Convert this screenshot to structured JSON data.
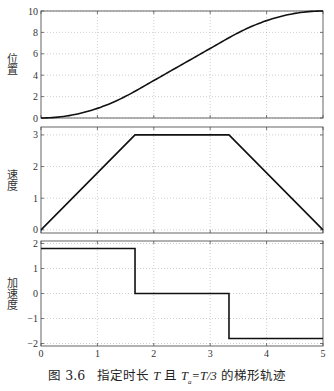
{
  "caption": {
    "figure_number": "图 3.6",
    "text": "指定时长 T 且 Ta = T/3 的梯形轨迹",
    "parts": [
      "图 3.6",
      "指定时长",
      "T",
      "且",
      "T",
      "a",
      "=T/3",
      "的梯形轨迹"
    ]
  },
  "chart_data": [
    {
      "type": "line",
      "title": "",
      "xlabel": "",
      "ylabel": "位置",
      "xlim": [
        0,
        5
      ],
      "ylim": [
        0,
        10
      ],
      "xticks": [
        0,
        1,
        2,
        3,
        4,
        5
      ],
      "yticks": [
        0,
        2,
        4,
        6,
        8,
        10
      ],
      "grid": true,
      "x": [
        0,
        0.5,
        1,
        1.667,
        2,
        2.5,
        3,
        3.333,
        3.5,
        4,
        4.5,
        5
      ],
      "values": [
        0,
        0.225,
        0.9,
        2.5,
        3.5,
        5.0,
        6.5,
        7.5,
        8.0,
        9.1,
        9.775,
        10
      ],
      "series": [
        {
          "name": "position",
          "color": "#111111"
        }
      ]
    },
    {
      "type": "line",
      "title": "",
      "xlabel": "",
      "ylabel": "速度",
      "xlim": [
        0,
        5
      ],
      "ylim": [
        -0.1,
        3.25
      ],
      "xticks": [
        0,
        1,
        2,
        3,
        4,
        5
      ],
      "yticks": [
        0,
        1,
        2,
        3
      ],
      "grid": true,
      "x": [
        0,
        1.667,
        3.333,
        5
      ],
      "values": [
        0,
        3,
        3,
        0
      ],
      "series": [
        {
          "name": "velocity",
          "color": "#111111"
        }
      ]
    },
    {
      "type": "line",
      "title": "",
      "xlabel": "",
      "ylabel": "加速度",
      "xlim": [
        0,
        5
      ],
      "ylim": [
        -2.1,
        2.1
      ],
      "xticks": [
        0,
        1,
        2,
        3,
        4,
        5
      ],
      "yticks": [
        -2,
        -1,
        0,
        1,
        2
      ],
      "grid": true,
      "x": [
        0,
        1.667,
        1.667,
        3.333,
        3.333,
        5
      ],
      "values": [
        1.8,
        1.8,
        0,
        0,
        -1.8,
        -1.8
      ],
      "series": [
        {
          "name": "acceleration",
          "color": "#111111"
        }
      ]
    }
  ]
}
